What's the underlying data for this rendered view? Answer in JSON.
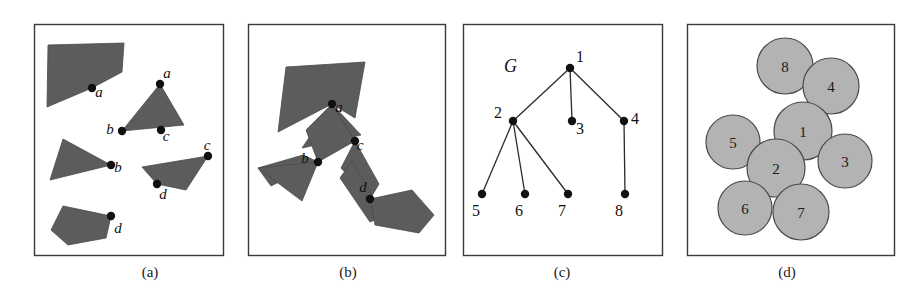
{
  "figure": {
    "width": 924,
    "height": 297,
    "background": "#ffffff",
    "shape_fill": "#5c5c5c",
    "disc_fill": "#b3b3b3",
    "stroke": "#3a3a3a"
  },
  "panels": [
    {
      "id": "a",
      "caption": "(a)",
      "caption_x": 150,
      "caption_y": 277,
      "frame": {
        "x": 34,
        "y": 24,
        "w": 189,
        "h": 231
      },
      "description": "Four separate dark polygons each with one marked contact point labelled a, b, c, d",
      "shapes": [
        {
          "name": "polygon-a-top-left",
          "points": "48,45 124,43 122,72 92,88 47,107"
        },
        {
          "name": "polygon-a-triangle-abc",
          "points": "160,84 184,125 122,131"
        },
        {
          "name": "polygon-a-triangle-b",
          "points": "63,139 111,165 50,180"
        },
        {
          "name": "polygon-a-parallelogram-cd",
          "points": "208,156 186,190 157,184 142,167"
        },
        {
          "name": "polygon-a-bottom-left",
          "points": "63,206 111,216 106,238 68,245 51,230"
        }
      ],
      "points": [
        {
          "id": "a",
          "x": 92,
          "y": 88,
          "label": "a",
          "lx": 99,
          "ly": 97
        },
        {
          "id": "a2",
          "x": 160,
          "y": 84,
          "label": "a",
          "lx": 167,
          "ly": 78
        },
        {
          "id": "b",
          "x": 122,
          "y": 131,
          "label": "b",
          "lx": 110,
          "ly": 134
        },
        {
          "id": "c",
          "x": 161,
          "y": 130,
          "label": "c",
          "lx": 166,
          "ly": 141
        },
        {
          "id": "b2",
          "x": 111,
          "y": 165,
          "label": "b",
          "lx": 118,
          "ly": 172
        },
        {
          "id": "c2",
          "x": 208,
          "y": 156,
          "label": "c",
          "lx": 207,
          "ly": 150
        },
        {
          "id": "d",
          "x": 157,
          "y": 184,
          "label": "d",
          "lx": 163,
          "ly": 199
        },
        {
          "id": "d2",
          "x": 111,
          "y": 216,
          "label": "d",
          "lx": 118,
          "ly": 233
        }
      ]
    },
    {
      "id": "b",
      "caption": "(b)",
      "caption_x": 348,
      "caption_y": 277,
      "frame": {
        "x": 248,
        "y": 24,
        "w": 197,
        "h": 231
      },
      "description": "The same polygons moved together so that the marked points a, b, c, d touch and form a connected assembly",
      "shapes": [
        {
          "name": "polygon-b-top-left",
          "points": "286,67 365,62 355,118 332,104 278,132"
        },
        {
          "name": "polygon-b-triangle-abc",
          "points": "332,104 361,135 302,148"
        },
        {
          "name": "polygon-b-strip-ab",
          "points": "332,104 355,141 318,162 306,130"
        },
        {
          "name": "polygon-b-triangle-b",
          "points": "318,162 271,186 258,168 303,155"
        },
        {
          "name": "polygon-b-left-wedge",
          "points": "318,162 302,201 258,168"
        },
        {
          "name": "polygon-b-strip-cd",
          "points": "355,141 379,184 370,199 341,168"
        },
        {
          "name": "polygon-b-lower-strip",
          "points": "352,161 384,216 370,222 340,178"
        },
        {
          "name": "polygon-b-bottom-right",
          "points": "370,199 412,190 434,215 419,233 375,225"
        }
      ],
      "points": [
        {
          "id": "a",
          "x": 332,
          "y": 104,
          "label": "a",
          "lx": 339,
          "ly": 112
        },
        {
          "id": "b",
          "x": 318,
          "y": 162,
          "label": "b",
          "lx": 305,
          "ly": 163
        },
        {
          "id": "c",
          "x": 355,
          "y": 141,
          "label": "c",
          "lx": 360,
          "ly": 150
        },
        {
          "id": "d",
          "x": 370,
          "y": 199,
          "label": "d",
          "lx": 363,
          "ly": 192
        }
      ]
    },
    {
      "id": "c",
      "caption": "(c)",
      "caption_x": 562,
      "caption_y": 277,
      "frame": {
        "x": 463,
        "y": 24,
        "w": 199,
        "h": 231
      },
      "graph_name": "G",
      "graph_name_x": 504,
      "graph_name_y": 72,
      "description": "Tree graph G with 8 numbered nodes",
      "nodes": [
        {
          "id": "1",
          "x": 570,
          "y": 68,
          "label": "1",
          "lx": 580,
          "ly": 62
        },
        {
          "id": "2",
          "x": 513,
          "y": 121,
          "label": "2",
          "lx": 498,
          "ly": 118
        },
        {
          "id": "3",
          "x": 572,
          "y": 121,
          "label": "3",
          "lx": 580,
          "ly": 134
        },
        {
          "id": "4",
          "x": 624,
          "y": 121,
          "label": "4",
          "lx": 635,
          "ly": 124
        },
        {
          "id": "5",
          "x": 482,
          "y": 194,
          "label": "5",
          "lx": 476,
          "ly": 216
        },
        {
          "id": "6",
          "x": 525,
          "y": 194,
          "label": "6",
          "lx": 519,
          "ly": 216
        },
        {
          "id": "7",
          "x": 568,
          "y": 194,
          "label": "7",
          "lx": 562,
          "ly": 216
        },
        {
          "id": "8",
          "x": 625,
          "y": 194,
          "label": "8",
          "lx": 619,
          "ly": 216
        }
      ],
      "edges": [
        [
          "1",
          "2"
        ],
        [
          "1",
          "3"
        ],
        [
          "1",
          "4"
        ],
        [
          "2",
          "5"
        ],
        [
          "2",
          "6"
        ],
        [
          "2",
          "7"
        ],
        [
          "4",
          "8"
        ]
      ]
    },
    {
      "id": "d",
      "caption": "(d)",
      "caption_x": 787,
      "caption_y": 277,
      "frame": {
        "x": 687,
        "y": 24,
        "w": 207,
        "h": 231
      },
      "description": "Eight numbered gray discs packed so that touching pairs correspond to edges of G",
      "discs": [
        {
          "id": "8",
          "cx": 785,
          "cy": 66,
          "r": 28,
          "label": "8"
        },
        {
          "id": "4",
          "cx": 831,
          "cy": 86,
          "r": 28,
          "label": "4"
        },
        {
          "id": "1",
          "cx": 803,
          "cy": 131,
          "r": 29,
          "label": "1"
        },
        {
          "id": "5",
          "cx": 733,
          "cy": 142,
          "r": 27,
          "label": "5"
        },
        {
          "id": "3",
          "cx": 845,
          "cy": 161,
          "r": 27,
          "label": "3"
        },
        {
          "id": "2",
          "cx": 776,
          "cy": 168,
          "r": 29,
          "label": "2"
        },
        {
          "id": "6",
          "cx": 745,
          "cy": 208,
          "r": 27,
          "label": "6"
        },
        {
          "id": "7",
          "cx": 801,
          "cy": 212,
          "r": 28,
          "label": "7"
        }
      ]
    }
  ]
}
